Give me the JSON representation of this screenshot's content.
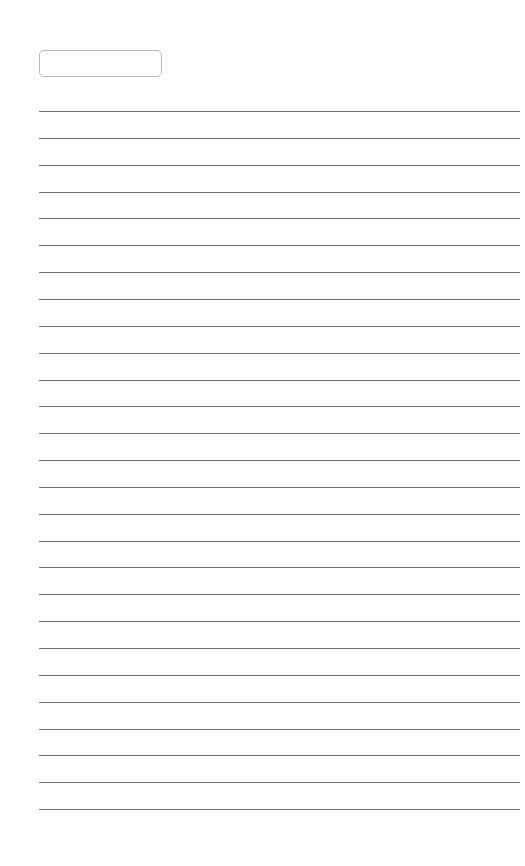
{
  "page": {
    "label_box": {
      "text": ""
    },
    "ruled_lines": {
      "count": 27,
      "first_y": 111,
      "spacing": 26.85,
      "color": "#6e6e6e"
    }
  }
}
